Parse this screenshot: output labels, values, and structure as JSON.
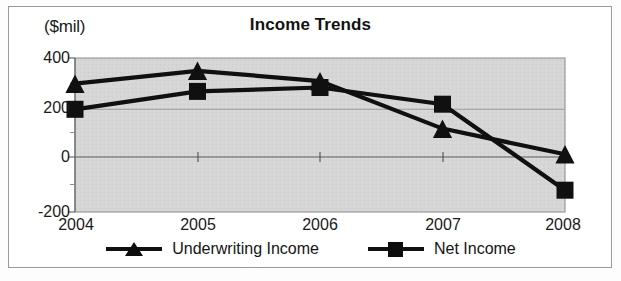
{
  "chart_data": {
    "type": "line",
    "title": "Income Trends",
    "xlabel": "",
    "ylabel": "($mil)",
    "ylim": [
      -200,
      400
    ],
    "yticks": [
      400,
      200,
      0,
      -200
    ],
    "ytick_labels": [
      "400",
      "200",
      "0",
      "-200"
    ],
    "categories": [
      "2004",
      "2005",
      "2006",
      "2007",
      "2008"
    ],
    "x": [
      2004,
      2005,
      2006,
      2007,
      2008
    ],
    "grid": true,
    "legend_position": "bottom",
    "plot_background": "#d4d4d4",
    "series": [
      {
        "name": "Underwriting Income",
        "marker": "triangle",
        "color": "#101010",
        "values": [
          300,
          350,
          310,
          125,
          25
        ]
      },
      {
        "name": "Net Income",
        "marker": "square",
        "color": "#101010",
        "values": [
          200,
          270,
          285,
          220,
          -115
        ]
      }
    ]
  },
  "figure": {
    "unit_label": "($mil)",
    "title": "Income Trends",
    "y_axis_ticks": [
      "400",
      "200",
      "0",
      "-200"
    ],
    "x_axis_ticks": [
      "2004",
      "2005",
      "2006",
      "2007",
      "2008"
    ],
    "legend": [
      {
        "label": "Underwriting Income",
        "marker": "triangle-marker-icon"
      },
      {
        "label": "Net Income",
        "marker": "square-marker-icon"
      }
    ]
  }
}
